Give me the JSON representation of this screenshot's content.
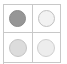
{
  "widget": {
    "name": "circle-swatch-grid",
    "columns": 2,
    "rows": 2,
    "frame_color": "#c8c8c8",
    "background": "#ffffff"
  },
  "cells": [
    {
      "id": "cell-top-left",
      "label": "",
      "swatch_name": "circle-swatch-filled-dark",
      "fill": "#969696",
      "stroke": "#8a8a8a",
      "state": "selected"
    },
    {
      "id": "cell-top-right",
      "label": "",
      "swatch_name": "circle-swatch-light",
      "fill": "#f2f2f2",
      "stroke": "#c0c0c0",
      "state": "unselected"
    },
    {
      "id": "cell-bottom-left",
      "label": "",
      "swatch_name": "circle-swatch-medium-light",
      "fill": "#dcdcdc",
      "stroke": "#c4c4c4",
      "state": "unselected"
    },
    {
      "id": "cell-bottom-right",
      "label": "",
      "swatch_name": "circle-swatch-lightest",
      "fill": "#ededed",
      "stroke": "#cfcfcf",
      "state": "unselected"
    }
  ]
}
